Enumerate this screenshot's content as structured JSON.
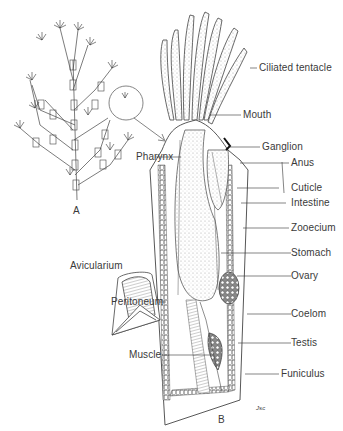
{
  "figure": {
    "panel_a_label": "A",
    "panel_b_label": "B",
    "signature": "Jsc"
  },
  "labels": {
    "ciliated_tentacle": "Ciliated tentacle",
    "mouth": "Mouth",
    "ganglion": "Ganglion",
    "anus": "Anus",
    "pharynx": "Pharynx",
    "cuticle": "Cuticle",
    "intestine": "Intestine",
    "zooecium": "Zooecium",
    "stomach": "Stomach",
    "avicularium": "Avicularium",
    "ovary": "Ovary",
    "peritoneum": "Peritoneum",
    "coelom": "Coelom",
    "muscle": "Muscle",
    "testis": "Testis",
    "funiculus": "Funiculus"
  },
  "colors": {
    "ink": "#3a3a3a",
    "background": "#ffffff",
    "stipple": "#d8d8d8"
  }
}
